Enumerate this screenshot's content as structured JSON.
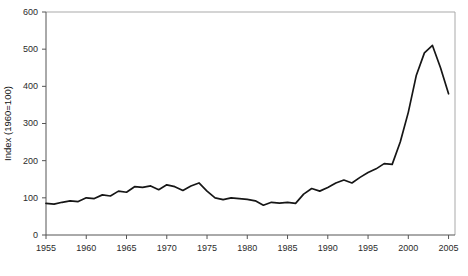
{
  "chart_data": {
    "type": "line",
    "title": "",
    "subtitle": "",
    "xlabel": "",
    "ylabel": "Index (1960=100)",
    "xlim": [
      1955,
      2005.8
    ],
    "ylim": [
      0,
      600
    ],
    "grid": false,
    "legend": null,
    "legend_position": "none",
    "x_ticks": [
      1955,
      1960,
      1965,
      1970,
      1975,
      1980,
      1985,
      1990,
      1995,
      2000,
      2005
    ],
    "x_tick_labels": [
      "1955",
      "1960",
      "1965",
      "1970",
      "1975",
      "1980",
      "1985",
      "1990",
      "1995",
      "2000",
      "2005"
    ],
    "y_ticks": [
      0,
      100,
      200,
      300,
      400,
      500,
      600
    ],
    "y_tick_labels": [
      "0",
      "100",
      "200",
      "300",
      "400",
      "500",
      "600"
    ],
    "series": [
      {
        "name": "Index (1960=100)",
        "color": "#161616",
        "x": [
          1955,
          1956,
          1957,
          1958,
          1959,
          1960,
          1961,
          1962,
          1963,
          1964,
          1965,
          1966,
          1967,
          1968,
          1969,
          1970,
          1971,
          1972,
          1973,
          1974,
          1975,
          1976,
          1977,
          1978,
          1979,
          1980,
          1981,
          1982,
          1983,
          1984,
          1985,
          1986,
          1987,
          1988,
          1989,
          1990,
          1991,
          1992,
          1993,
          1994,
          1995,
          1996,
          1997,
          1998,
          1999,
          2000,
          2001,
          2002,
          2003,
          2004,
          2005
        ],
        "values": [
          85,
          83,
          88,
          92,
          90,
          100,
          98,
          108,
          105,
          118,
          115,
          130,
          128,
          132,
          122,
          135,
          130,
          120,
          132,
          140,
          118,
          100,
          95,
          100,
          98,
          96,
          92,
          80,
          88,
          86,
          88,
          85,
          110,
          125,
          118,
          128,
          140,
          148,
          140,
          155,
          168,
          178,
          192,
          190,
          250,
          330,
          430,
          490,
          510,
          450,
          380
        ],
        "marker": "none",
        "line_width": 1.7
      }
    ],
    "annotations": []
  },
  "geometry": {
    "plot_left": 46,
    "plot_right": 455,
    "plot_top": 12,
    "plot_bottom": 235
  }
}
